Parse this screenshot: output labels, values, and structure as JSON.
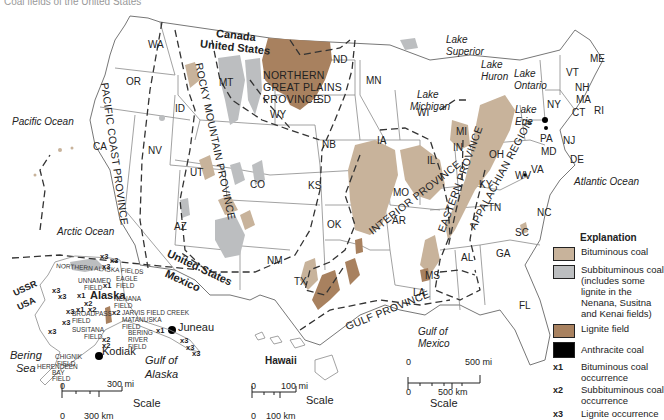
{
  "title": "Coal fields of the United States",
  "colors": {
    "bituminous": "#c8b39b",
    "subbituminous": "#bcbec0",
    "lignite": "#a8815f",
    "anthracite": "#000000",
    "boundary": "#8a8a8a",
    "province_line": "#333333"
  },
  "countries": {
    "canada": "Canada",
    "united_states_north": "United States",
    "united_states_south": "United States",
    "mexico": "Mexico",
    "ussr": "USSR",
    "usa": "USA"
  },
  "states": [
    "WA",
    "OR",
    "CA",
    "ID",
    "NV",
    "MT",
    "WY",
    "UT",
    "CO",
    "AZ",
    "NM",
    "ND",
    "SD",
    "NB",
    "KS",
    "OK",
    "TX",
    "MN",
    "IA",
    "MO",
    "AR",
    "LA",
    "WI",
    "MI",
    "IL",
    "IN",
    "OH",
    "KY",
    "TN",
    "MS",
    "AL",
    "GA",
    "FL",
    "SC",
    "NC",
    "VA",
    "WV",
    "MD",
    "DE",
    "PA",
    "NJ",
    "NY",
    "CT",
    "RI",
    "MA",
    "NH",
    "VT",
    "ME"
  ],
  "water_bodies": {
    "pacific": "Pacific Ocean",
    "atlantic": "Atlantic Ocean",
    "arctic": "Arctic Ocean",
    "gulf_mexico_1": "Gulf of",
    "gulf_mexico_2": "Mexico",
    "gulf_alaska_1": "Gulf of",
    "gulf_alaska_2": "Alaska",
    "bering_1": "Bering",
    "bering_2": "Sea",
    "lake_superior_1": "Lake",
    "lake_superior_2": "Superior",
    "lake_huron_1": "Lake",
    "lake_huron_2": "Huron",
    "lake_michigan_1": "Lake",
    "lake_michigan_2": "Michigan",
    "lake_ontario_1": "Lake",
    "lake_ontario_2": "Ontario",
    "lake_erie_1": "Lake",
    "lake_erie_2": "Erie"
  },
  "provinces": {
    "pacific_coast": "PACIFIC COAST PROVINCE",
    "rocky_mountain": "ROCKY MOUNTAIN PROVINCE",
    "northern_great_plains": [
      "NORTHERN",
      "GREAT PLAINS",
      "PROVINCE"
    ],
    "interior": "INTERIOR PROVINCE",
    "eastern": "EASTERN PROVINCE",
    "appalachian": "APPALACHIAN REGION",
    "gulf": "GULF PROVINCE"
  },
  "alaska": {
    "label": "Alaska",
    "cities": [
      "Juneau",
      "Kodiak"
    ],
    "fields": {
      "northern_alaska": "NORTHERN ALASKA FIELDS",
      "unnamed_1": "UNNAMED",
      "unnamed_2": "FIELD",
      "eagle_1": "EAGLE",
      "eagle_2": "FIELD",
      "nenana_1": "NENANA",
      "nenana_2": "FIELD",
      "jarvis": "JARVIS FIELD CREEK",
      "matanuska_1": "MATANUSKA",
      "matanuska_2": "FIELD",
      "broadpass_1": "BROADPASS",
      "broadpass_2": "FIELD",
      "susitana_1": "SUSITANA",
      "susitana_2": "FIELD",
      "bering_river_1": "BERING",
      "bering_river_2": "RIVER",
      "bering_river_3": "FIELD",
      "chignik_1": "CHIGNIK",
      "chignik_2": "FIELD",
      "herendeen_1": "HERENDEEN",
      "herendeen_2": "BAY",
      "herendeen_3": "FIELD"
    },
    "occurrence_markers": [
      "x1",
      "x2",
      "x3"
    ]
  },
  "hawaii": {
    "label": "Hawaii"
  },
  "scales": {
    "alaska": {
      "mi_zero": "0",
      "mi": "300 mi",
      "km_zero": "0",
      "km": "300 km",
      "label": "Scale"
    },
    "hawaii": {
      "mi_zero": "0",
      "mi": "100 mi",
      "km_zero": "0",
      "km": "100 km",
      "label": "Scale"
    },
    "main": {
      "mi_zero": "0",
      "mi": "500 mi",
      "km_zero": "0",
      "km": "500 km",
      "label": "Scale"
    }
  },
  "legend": {
    "title": "Explanation",
    "items": [
      {
        "label": "Bituminous coal",
        "color": "#c8b39b"
      },
      {
        "label": "Subbituminous coal (includes some lignite in the Nenana, Susitna and Kenai fields)",
        "color": "#bcbec0"
      },
      {
        "label": "Lignite field",
        "color": "#a8815f"
      },
      {
        "label": "Anthracite coal",
        "color": "#000000"
      }
    ],
    "occurrences": [
      {
        "code": "x1",
        "label": "Bituminous coal occurrence"
      },
      {
        "code": "x2",
        "label": "Subbituminous coal occurrence"
      },
      {
        "code": "x3",
        "label": "Lignite occurrence"
      }
    ]
  }
}
